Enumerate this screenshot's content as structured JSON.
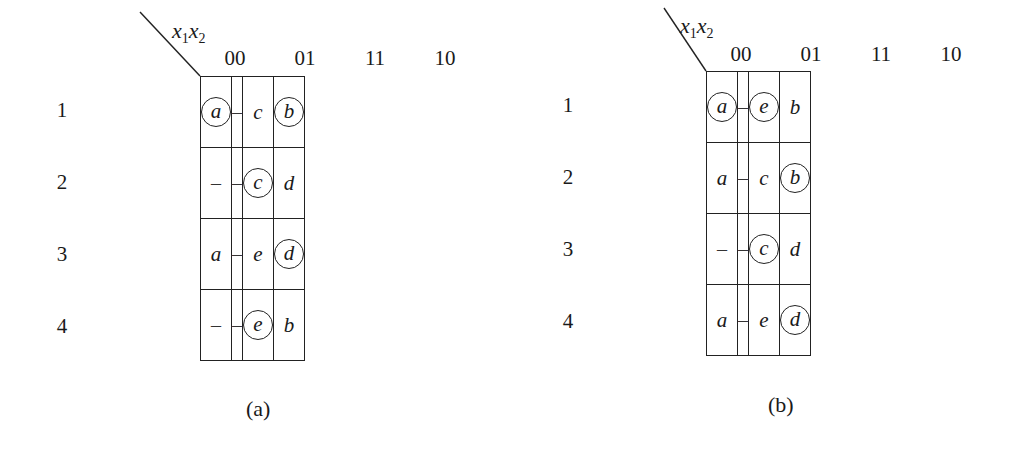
{
  "figure": {
    "column_variable": "x1x2",
    "panels": [
      {
        "id": "a",
        "caption": "(a)",
        "var_label": {
          "x": "x",
          "one": "1",
          "two": "2"
        },
        "columns": [
          "00",
          "01",
          "11",
          "10"
        ],
        "rows": [
          {
            "number": "1",
            "states": [
              "a",
              "b"
            ],
            "cells": [
              {
                "v": "a",
                "circled": true
              },
              {
                "v": "–",
                "circled": false
              },
              {
                "v": "c",
                "circled": false
              },
              {
                "v": "b",
                "circled": true
              }
            ]
          },
          {
            "number": "2",
            "states": [
              "c"
            ],
            "cells": [
              {
                "v": "–",
                "circled": false
              },
              {
                "v": "–",
                "circled": false
              },
              {
                "v": "c",
                "circled": true
              },
              {
                "v": "d",
                "circled": false
              }
            ]
          },
          {
            "number": "3",
            "states": [
              "d"
            ],
            "cells": [
              {
                "v": "a",
                "circled": false
              },
              {
                "v": "–",
                "circled": false
              },
              {
                "v": "e",
                "circled": false
              },
              {
                "v": "d",
                "circled": true
              }
            ]
          },
          {
            "number": "4",
            "states": [
              "e"
            ],
            "cells": [
              {
                "v": "–",
                "circled": false
              },
              {
                "v": "–",
                "circled": false
              },
              {
                "v": "e",
                "circled": true
              },
              {
                "v": "b",
                "circled": false
              }
            ]
          }
        ]
      },
      {
        "id": "b",
        "caption": "(b)",
        "var_label": {
          "x": "x",
          "one": "1",
          "two": "2"
        },
        "columns": [
          "00",
          "01",
          "11",
          "10"
        ],
        "rows": [
          {
            "number": "1",
            "states": [
              "a",
              "e"
            ],
            "cells": [
              {
                "v": "a",
                "circled": true
              },
              {
                "v": "–",
                "circled": false
              },
              {
                "v": "e",
                "circled": true
              },
              {
                "v": "b",
                "circled": false
              }
            ]
          },
          {
            "number": "2",
            "states": [
              "b"
            ],
            "cells": [
              {
                "v": "a",
                "circled": false
              },
              {
                "v": "–",
                "circled": false
              },
              {
                "v": "c",
                "circled": false
              },
              {
                "v": "b",
                "circled": true
              }
            ]
          },
          {
            "number": "3",
            "states": [
              "c"
            ],
            "cells": [
              {
                "v": "–",
                "circled": false
              },
              {
                "v": "–",
                "circled": false
              },
              {
                "v": "c",
                "circled": true
              },
              {
                "v": "d",
                "circled": false
              }
            ]
          },
          {
            "number": "4",
            "states": [
              "d"
            ],
            "cells": [
              {
                "v": "a",
                "circled": false
              },
              {
                "v": "–",
                "circled": false
              },
              {
                "v": "e",
                "circled": false
              },
              {
                "v": "d",
                "circled": true
              }
            ]
          }
        ]
      }
    ]
  },
  "layout": {
    "panels": [
      {
        "grid_left": 200,
        "grid_top": 76,
        "col_hdr_top": 46,
        "rownum_left": 52,
        "state_right": 190,
        "var_left": 172,
        "var_top": 18,
        "diag": [
          140,
          12,
          200,
          76
        ],
        "caption_left": 246,
        "caption_top": 396
      },
      {
        "grid_left": 706,
        "grid_top": 71,
        "col_hdr_top": 42,
        "rownum_left": 558,
        "state_right": 696,
        "var_left": 680,
        "var_top": 13,
        "diag": [
          664,
          8,
          706,
          71
        ],
        "caption_left": 768,
        "caption_top": 392
      }
    ]
  }
}
